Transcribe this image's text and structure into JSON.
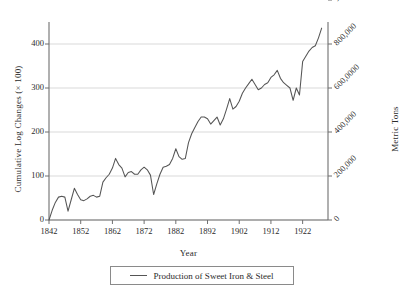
{
  "chart_data": {
    "type": "line",
    "title": "",
    "xlabel": "Year",
    "ylabel": "Cumulative Log Changes (× 100)",
    "y2label": "Metric Tons",
    "xlim": [
      1842,
      1930
    ],
    "ylim": [
      -10,
      450
    ],
    "grid": true,
    "legend_position": "bottom",
    "xticks": [
      1842,
      1852,
      1862,
      1872,
      1882,
      1892,
      1902,
      1912,
      1922
    ],
    "xticklabels": [
      "1842",
      "1852",
      "1862",
      "1872",
      "1882",
      "1892",
      "1902",
      "1912",
      "1922"
    ],
    "yticks": [
      0,
      100,
      200,
      300,
      400
    ],
    "yticklabels": [
      "0",
      "100",
      "200",
      "300",
      "400"
    ],
    "y2ticks": [
      0,
      100,
      200,
      300,
      400
    ],
    "y2ticklabels": [
      "0",
      "200,000",
      "400,000",
      "600,0000",
      "800,000",
      "1 million"
    ],
    "series": [
      {
        "name": "Production of Sweet Iron & Steel",
        "color": "#555555",
        "x": [
          1842,
          1843,
          1844,
          1845,
          1846,
          1847,
          1848,
          1849,
          1850,
          1851,
          1852,
          1853,
          1854,
          1855,
          1856,
          1857,
          1858,
          1859,
          1860,
          1861,
          1862,
          1863,
          1864,
          1865,
          1866,
          1867,
          1868,
          1869,
          1870,
          1871,
          1872,
          1873,
          1874,
          1875,
          1876,
          1877,
          1878,
          1879,
          1880,
          1881,
          1882,
          1883,
          1884,
          1885,
          1886,
          1887,
          1888,
          1889,
          1890,
          1891,
          1892,
          1893,
          1894,
          1895,
          1896,
          1897,
          1898,
          1899,
          1900,
          1901,
          1902,
          1903,
          1904,
          1905,
          1906,
          1907,
          1908,
          1909,
          1910,
          1911,
          1912,
          1913,
          1914,
          1915,
          1916,
          1917,
          1918,
          1919,
          1920,
          1921,
          1922,
          1923,
          1924,
          1925,
          1926,
          1927,
          1928
        ],
        "values": [
          0,
          22,
          40,
          52,
          54,
          52,
          20,
          46,
          72,
          58,
          46,
          44,
          48,
          54,
          56,
          52,
          54,
          86,
          96,
          104,
          118,
          140,
          126,
          118,
          98,
          108,
          110,
          104,
          104,
          114,
          120,
          114,
          102,
          58,
          82,
          104,
          120,
          122,
          126,
          140,
          162,
          144,
          138,
          140,
          176,
          196,
          210,
          224,
          234,
          234,
          230,
          218,
          226,
          234,
          216,
          230,
          252,
          276,
          252,
          258,
          270,
          288,
          300,
          310,
          320,
          308,
          296,
          300,
          308,
          312,
          324,
          330,
          340,
          322,
          312,
          306,
          300,
          272,
          300,
          284,
          360,
          372,
          384,
          392,
          396,
          414,
          436
        ]
      }
    ]
  },
  "legend": {
    "entry_label": "Production of Sweet Iron & Steel",
    "swatch": "line-swatch"
  }
}
